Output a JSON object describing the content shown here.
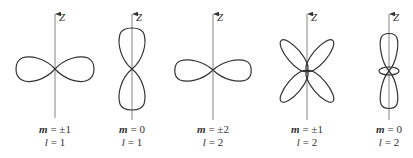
{
  "figure": {
    "title": "",
    "axis_label": "Z",
    "panels": [
      {
        "id": "p1",
        "m_label": "m",
        "m_value": "= ±1",
        "l_label": "l",
        "l_value": "= 1",
        "shape": "horizontal-dumbbell",
        "axis_x": 55,
        "center_y": 69
      },
      {
        "id": "p2",
        "m_label": "m",
        "m_value": "= 0",
        "l_label": "l",
        "l_value": "= 1",
        "shape": "vertical-dumbbell",
        "axis_x": 132,
        "center_y": 69
      },
      {
        "id": "p3",
        "m_label": "m",
        "m_value": "= ±2",
        "l_label": "l",
        "l_value": "= 2",
        "shape": "horizontal-dumbbell",
        "axis_x": 213,
        "center_y": 70
      },
      {
        "id": "p4",
        "m_label": "m",
        "m_value": "= ±1",
        "l_label": "l",
        "l_value": "= 2",
        "shape": "four-lobe-cloverleaf",
        "axis_x": 307,
        "center_y": 71
      },
      {
        "id": "p5",
        "m_label": "m",
        "m_value": "= 0",
        "l_label": "l",
        "l_value": "= 2",
        "shape": "vertical-dumbbell-with-torus",
        "axis_x": 389,
        "center_y": 71
      }
    ],
    "colors": {
      "stroke": "#333333",
      "axis": "#666666",
      "background": "#ffffff"
    }
  }
}
